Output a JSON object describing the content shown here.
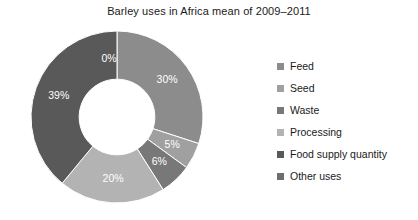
{
  "chart_data": {
    "type": "pie",
    "variant": "donut",
    "title": "Barley uses in Africa mean of 2009–2011",
    "xlabel": "",
    "ylabel": "",
    "grid": false,
    "legend_position": "right",
    "start_angle_deg": 0,
    "direction": "clockwise",
    "inner_radius_ratio": 0.44,
    "categories": [
      "Feed",
      "Seed",
      "Waste",
      "Processing",
      "Food supply quantity",
      "Other uses"
    ],
    "values": [
      30,
      5,
      6,
      20,
      39,
      0
    ],
    "data_labels": [
      "30%",
      "5%",
      "6%",
      "20%",
      "39%",
      "0%"
    ],
    "colors": [
      "#8c8c8c",
      "#a0a0a0",
      "#787878",
      "#b3b3b3",
      "#595959",
      "#6e6e6e"
    ],
    "slices": [
      {
        "label": "Feed",
        "value": 30,
        "data_label": "30%",
        "color": "#8c8c8c"
      },
      {
        "label": "Seed",
        "value": 5,
        "data_label": "5%",
        "color": "#a0a0a0"
      },
      {
        "label": "Waste",
        "value": 6,
        "data_label": "6%",
        "color": "#787878"
      },
      {
        "label": "Processing",
        "value": 20,
        "data_label": "20%",
        "color": "#b3b3b3"
      },
      {
        "label": "Food supply quantity",
        "value": 39,
        "data_label": "39%",
        "color": "#595959"
      },
      {
        "label": "Other uses",
        "value": 0,
        "data_label": "0%",
        "color": "#6e6e6e"
      }
    ]
  },
  "legend": {
    "items": [
      {
        "label": "Feed",
        "color": "#8c8c8c"
      },
      {
        "label": "Seed",
        "color": "#a0a0a0"
      },
      {
        "label": "Waste",
        "color": "#787878"
      },
      {
        "label": "Processing",
        "color": "#b3b3b3"
      },
      {
        "label": "Food supply quantity",
        "color": "#595959"
      },
      {
        "label": "Other uses",
        "color": "#6e6e6e"
      }
    ]
  },
  "style": {
    "background": "#ffffff",
    "text_color": "#1a1a1a",
    "label_color": "#ffffff",
    "slice_border": "#ffffff"
  }
}
